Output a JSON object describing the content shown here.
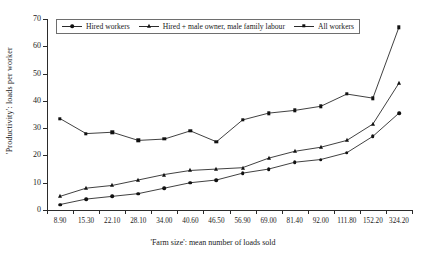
{
  "chart_data": {
    "type": "line",
    "title": "",
    "xlabel": "'Farm size': mean number of loads sold",
    "ylabel": "'Productivity': loads per worker",
    "categories": [
      "8.90",
      "15.30",
      "22.10",
      "28.10",
      "34.00",
      "40.60",
      "46.50",
      "56.90",
      "69.00",
      "81.40",
      "92.00",
      "111.80",
      "152.20",
      "324.20"
    ],
    "ylim": [
      0,
      70
    ],
    "yticks": [
      0,
      10,
      20,
      30,
      40,
      50,
      60,
      70
    ],
    "grid": false,
    "legend_position": "top-inside",
    "series": [
      {
        "name": "Hired workers",
        "marker": "circle",
        "values": [
          2.0,
          4.0,
          5.0,
          6.0,
          8.0,
          10.0,
          11.0,
          13.5,
          15.0,
          17.5,
          18.5,
          21.0,
          27.0,
          35.5
        ]
      },
      {
        "name": "Hired + male owner, male family labour",
        "marker": "triangle",
        "values": [
          5.0,
          8.0,
          9.0,
          11.0,
          13.0,
          14.5,
          15.0,
          15.5,
          19.0,
          21.5,
          23.0,
          25.5,
          31.5,
          46.5
        ]
      },
      {
        "name": "All workers",
        "marker": "square",
        "values": [
          33.5,
          28.0,
          28.5,
          25.5,
          26.0,
          29.0,
          25.0,
          33.0,
          35.5,
          36.5,
          38.0,
          42.5,
          41.0,
          67.0
        ]
      }
    ]
  },
  "axes": {
    "y_title": "'Productivity': loads per worker",
    "x_title": "'Farm size': mean number of loads sold"
  },
  "legend": {
    "items": [
      {
        "label": "Hired workers"
      },
      {
        "label": "Hired + male owner, male family labour"
      },
      {
        "label": "All workers"
      }
    ]
  },
  "colors": {
    "axis": "#2b2b2b",
    "series": "#2b2b2b",
    "marker": "#111111",
    "background": "#ffffff",
    "legend_border": "#6e6e6e"
  }
}
